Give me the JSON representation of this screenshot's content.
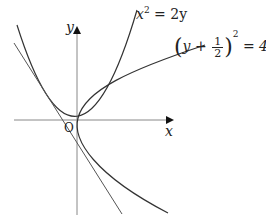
{
  "diagram": {
    "axes": {
      "x_label": "x",
      "y_label": "y",
      "origin_label": "O"
    },
    "curves": [
      {
        "name": "parabola-upward",
        "equation": "x^2 = 2y"
      },
      {
        "name": "parabola-sideways",
        "equation": "(y + 1/2)^2 = 4px"
      },
      {
        "name": "tangent-line",
        "equation": ""
      }
    ],
    "labels": {
      "eq1_base": "x",
      "eq1_exp": "2",
      "eq1_rest": " = 2y",
      "eq2_y": "y",
      "eq2_plus": " + ",
      "eq2_num": "1",
      "eq2_den": "2",
      "eq2_exp": "2",
      "eq2_rest": " = 4px"
    },
    "colors": {
      "axis": "#888888",
      "curve": "#333333",
      "text": "#222222"
    }
  }
}
